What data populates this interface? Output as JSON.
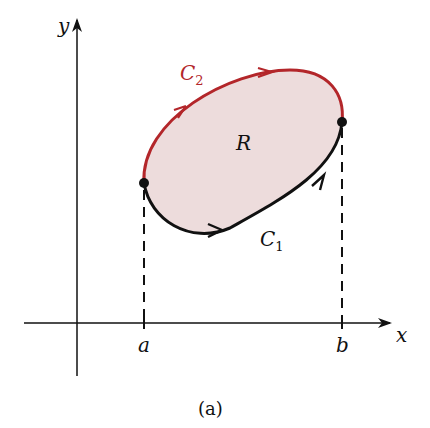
{
  "figure": {
    "caption": "(a)",
    "region_label": "R",
    "curve_lower": {
      "name": "C",
      "sub": "1",
      "color": "#111111"
    },
    "curve_upper": {
      "name": "C",
      "sub": "2",
      "color": "#b3262a"
    },
    "fill_color": "#eddcdc",
    "axes": {
      "x_label": "x",
      "y_label": "y"
    },
    "ticks": {
      "a": "a",
      "b": "b"
    }
  }
}
